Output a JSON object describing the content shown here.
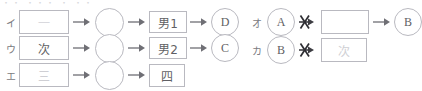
{
  "document": {
    "top_cutoff_sliver": "・・  ・・・ ・  ・・",
    "ink_color": "#6e6e72",
    "line_color": "#b9b9c0",
    "background": "#ffffff"
  },
  "left_column": {
    "rows": [
      {
        "label": "イ",
        "nodes": [
          {
            "kind": "box",
            "text": "一",
            "faded": true
          },
          {
            "kind": "arrow",
            "crossed": false
          },
          {
            "kind": "circle",
            "text": ""
          },
          {
            "kind": "arrow",
            "crossed": false
          },
          {
            "kind": "box",
            "text": "男1",
            "faded": false
          },
          {
            "kind": "arrow",
            "crossed": false
          },
          {
            "kind": "circle",
            "text": "D"
          }
        ]
      },
      {
        "label": "ウ",
        "nodes": [
          {
            "kind": "box",
            "text": "次",
            "faded": false
          },
          {
            "kind": "arrow",
            "crossed": false
          },
          {
            "kind": "circle",
            "text": ""
          },
          {
            "kind": "arrow",
            "crossed": false
          },
          {
            "kind": "box",
            "text": "男2",
            "faded": false
          },
          {
            "kind": "arrow",
            "crossed": false
          },
          {
            "kind": "circle",
            "text": "C"
          }
        ]
      },
      {
        "label": "エ",
        "nodes": [
          {
            "kind": "box",
            "text": "三",
            "faded": true
          },
          {
            "kind": "arrow",
            "crossed": false
          },
          {
            "kind": "circle",
            "text": ""
          },
          {
            "kind": "arrow",
            "crossed": false
          },
          {
            "kind": "box",
            "text": "四",
            "faded": false
          }
        ]
      }
    ]
  },
  "right_column": {
    "rows": [
      {
        "label": "オ",
        "nodes": [
          {
            "kind": "circle",
            "text": "A"
          },
          {
            "kind": "arrow",
            "crossed": true
          },
          {
            "kind": "box",
            "text": "",
            "faded": false
          },
          {
            "kind": "arrow",
            "crossed": false
          },
          {
            "kind": "circle",
            "text": "B"
          }
        ]
      },
      {
        "label": "カ",
        "nodes": [
          {
            "kind": "circle",
            "text": "B"
          },
          {
            "kind": "arrow",
            "crossed": true
          },
          {
            "kind": "box",
            "text": "次",
            "faded": true
          }
        ]
      }
    ]
  },
  "labels": {
    "row_i": "イ",
    "row_u": "ウ",
    "row_e": "エ",
    "row_o": "オ",
    "row_ka": "カ",
    "box_ichi": "一",
    "box_tsugi_1": "次",
    "box_otoko1": "男1",
    "box_otoko2": "男2",
    "box_san": "三",
    "box_shi": "四",
    "box_empty": "",
    "box_tsugi_2": "次",
    "circle_blank_1": "",
    "circle_blank_2": "",
    "circle_blank_3": "",
    "circle_d": "D",
    "circle_c": "C",
    "circle_a": "A",
    "circle_b1": "B",
    "circle_b2": "B"
  }
}
